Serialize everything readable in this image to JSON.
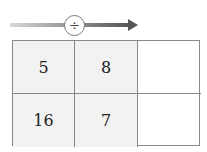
{
  "operation": {
    "symbol": "÷",
    "icon": "divide-icon",
    "arrow_direction": "right"
  },
  "grid": {
    "rows": [
      [
        {
          "value": "5",
          "shaded": true
        },
        {
          "value": "8",
          "shaded": true
        },
        {
          "value": "",
          "shaded": false
        }
      ],
      [
        {
          "value": "16",
          "shaded": true
        },
        {
          "value": "7",
          "shaded": true
        },
        {
          "value": "",
          "shaded": false
        }
      ]
    ]
  },
  "colors": {
    "shade": "#f2f2f2",
    "border": "#888888",
    "arrow_dark": "#555555",
    "arrow_light": "#d8d8d8"
  }
}
